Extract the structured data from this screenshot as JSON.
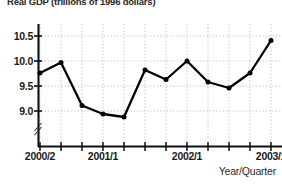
{
  "chart_data": {
    "type": "line",
    "title": "Real GDP (trillions of 1996 dollars)",
    "xlabel": "Year/Quarter",
    "ylabel": "",
    "ylim": [
      8.55,
      10.75
    ],
    "yticks": [
      9.0,
      9.5,
      10.0,
      10.5
    ],
    "ytick_labels": [
      "9.0",
      "9.5",
      "10.0",
      "10.5"
    ],
    "y_axis_break": true,
    "grid": true,
    "legend": "none",
    "x": [
      "2000/2",
      "2000/3",
      "2000/4",
      "2001/1",
      "2001/2",
      "2001/3",
      "2001/4",
      "2002/1",
      "2002/2",
      "2002/3",
      "2002/4",
      "2003/1"
    ],
    "xtick_labels": [
      "2000/2",
      "2001/1",
      "2002/1",
      "2003/1"
    ],
    "xtick_label_positions": [
      0,
      3,
      7,
      11
    ],
    "values": [
      9.76,
      9.97,
      9.11,
      8.94,
      8.88,
      9.82,
      9.63,
      10.0,
      9.58,
      9.46,
      9.76,
      10.41
    ],
    "marker": "filled-circle",
    "line_color": "#000000",
    "marker_color": "#000000",
    "grid_color": "#b8b8b8",
    "axis_color": "#1a1a1a"
  }
}
